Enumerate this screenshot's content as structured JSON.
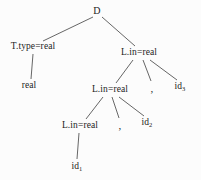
{
  "diagram": {
    "type": "tree",
    "width": 201,
    "height": 180,
    "background_color": "#fcfcfc",
    "edge_color": "#555555",
    "text_color": "#1d1d1d",
    "nodes": [
      {
        "id": "d",
        "label": "D",
        "x": 97,
        "y": 11,
        "kind": "root"
      },
      {
        "id": "ttype",
        "label": "T.type=real",
        "x": 33,
        "y": 47,
        "kind": "nonterminal"
      },
      {
        "id": "real",
        "label": "real",
        "x": 29,
        "y": 86,
        "kind": "leaf"
      },
      {
        "id": "lin1",
        "label": "L.in=real",
        "x": 139,
        "y": 53,
        "kind": "nonterminal"
      },
      {
        "id": "comma1",
        "label": ",",
        "x": 152,
        "y": 88,
        "kind": "comma"
      },
      {
        "id": "id3",
        "label": "id",
        "sub": "3",
        "x": 180,
        "y": 87,
        "kind": "leaf"
      },
      {
        "id": "lin2",
        "label": "L.in=real",
        "x": 110,
        "y": 90,
        "kind": "nonterminal"
      },
      {
        "id": "comma2",
        "label": ",",
        "x": 120,
        "y": 125,
        "kind": "comma"
      },
      {
        "id": "id2",
        "label": "id",
        "sub": "2",
        "x": 147,
        "y": 123,
        "kind": "leaf"
      },
      {
        "id": "lin3",
        "label": "L.in=real",
        "x": 80,
        "y": 126,
        "kind": "nonterminal"
      },
      {
        "id": "id1",
        "label": "id",
        "sub": "1",
        "x": 77,
        "y": 167,
        "kind": "leaf"
      }
    ],
    "edges": [
      {
        "from": "d",
        "to": "ttype",
        "x1": 93,
        "y1": 17,
        "x2": 43,
        "y2": 41
      },
      {
        "from": "d",
        "to": "lin1",
        "x1": 102,
        "y1": 17,
        "x2": 135,
        "y2": 46
      },
      {
        "from": "ttype",
        "to": "real",
        "x1": 33,
        "y1": 54,
        "x2": 31,
        "y2": 79
      },
      {
        "from": "lin1",
        "to": "lin2",
        "x1": 133,
        "y1": 60,
        "x2": 116,
        "y2": 83
      },
      {
        "from": "lin1",
        "to": "comma1",
        "x1": 143,
        "y1": 60,
        "x2": 151,
        "y2": 81
      },
      {
        "from": "lin1",
        "to": "id3",
        "x1": 150,
        "y1": 60,
        "x2": 177,
        "y2": 80
      },
      {
        "from": "lin2",
        "to": "lin3",
        "x1": 103,
        "y1": 97,
        "x2": 86,
        "y2": 119
      },
      {
        "from": "lin2",
        "to": "comma2",
        "x1": 112,
        "y1": 97,
        "x2": 119,
        "y2": 118
      },
      {
        "from": "lin2",
        "to": "id2",
        "x1": 119,
        "y1": 97,
        "x2": 144,
        "y2": 116
      },
      {
        "from": "lin3",
        "to": "id1",
        "x1": 79,
        "y1": 133,
        "x2": 77,
        "y2": 159
      }
    ]
  }
}
